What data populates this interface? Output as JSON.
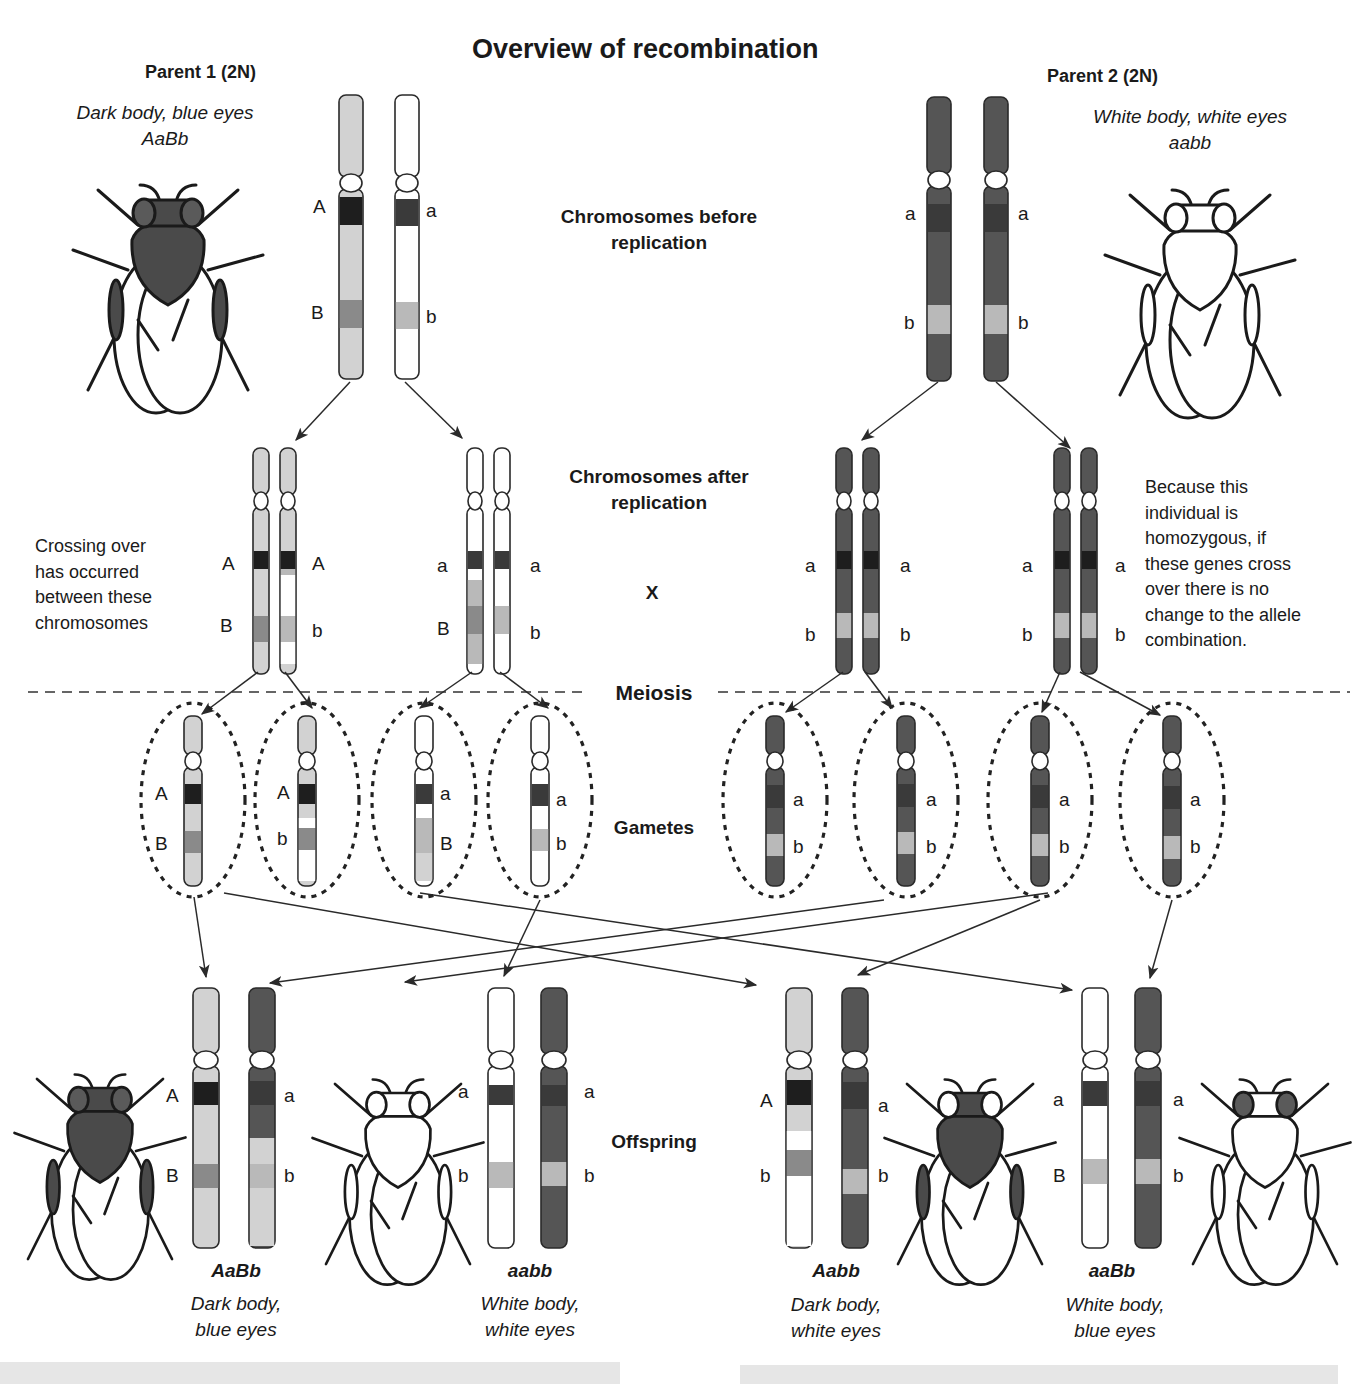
{
  "title": "Overview of recombination",
  "colors": {
    "light": "#d2d2d2",
    "white": "#ffffff",
    "dark": "#555555",
    "band_black": "#1e1e1e",
    "band_dark": "#3a3a3a",
    "band_mid": "#8a8a8a",
    "band_pale": "#b9b9b9",
    "outline": "#2a2a2a",
    "footer": "#e6e6e6"
  },
  "parent1": {
    "label": "Parent 1 (2N)",
    "phenotype": "Dark body, blue eyes",
    "genotype": "AaBb"
  },
  "parent2": {
    "label": "Parent 2 (2N)",
    "phenotype": "White body, white eyes",
    "genotype": "aabb"
  },
  "stages": {
    "before": "Chromosomes before replication",
    "before_l1": "Chromosomes before",
    "before_l2": "replication",
    "after_l1": "Chromosomes after",
    "after_l2": "replication",
    "cross": "X",
    "meiosis": "Meiosis",
    "gametes": "Gametes",
    "offspring": "Offspring"
  },
  "notes": {
    "crossing_over": "Crossing over\nhas occurred\nbetween these\nchromosomes",
    "homozygous": "Because this\nindividual is\nhomozygous, if\nthese genes cross\nover there is no\nchange to the allele\ncombination."
  },
  "alleles": {
    "A": "A",
    "a": "a",
    "B": "B",
    "b": "b"
  },
  "offspring": [
    {
      "genotype": "AaBb",
      "phenotype": "Dark body,\nblue eyes"
    },
    {
      "genotype": "aabb",
      "phenotype": "White body,\nwhite eyes"
    },
    {
      "genotype": "Aabb",
      "phenotype": "Dark body,\nwhite eyes"
    },
    {
      "genotype": "aaBb",
      "phenotype": "White body,\nblue eyes"
    }
  ]
}
